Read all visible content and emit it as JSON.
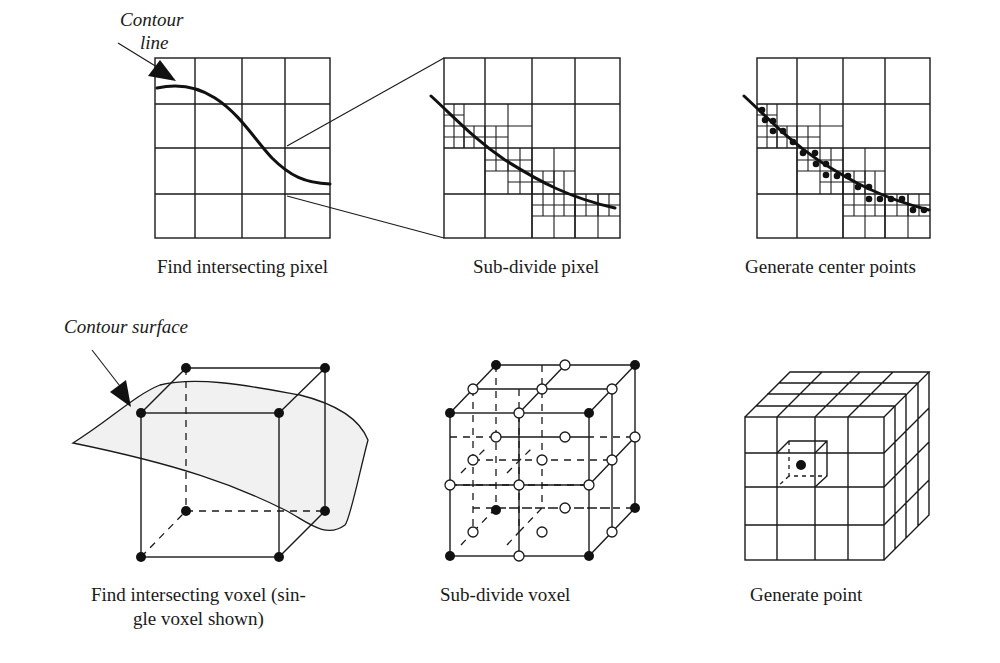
{
  "figure": {
    "top_row": {
      "annotation": {
        "line1": "Contour",
        "line2": "line"
      },
      "panels": [
        {
          "caption": "Find intersecting pixel"
        },
        {
          "caption": "Sub-divide pixel"
        },
        {
          "caption": "Generate center points"
        }
      ]
    },
    "bottom_row": {
      "annotation": "Contour surface",
      "panels": [
        {
          "caption_line1": "Find intersecting voxel (sin-",
          "caption_line2": "gle voxel shown)"
        },
        {
          "caption": "Sub-divide voxel"
        },
        {
          "caption": "Generate point"
        }
      ]
    },
    "colors": {
      "ink": "#1a1a1a",
      "surface_fill": "#f1f1f1",
      "background": "#ffffff"
    }
  }
}
